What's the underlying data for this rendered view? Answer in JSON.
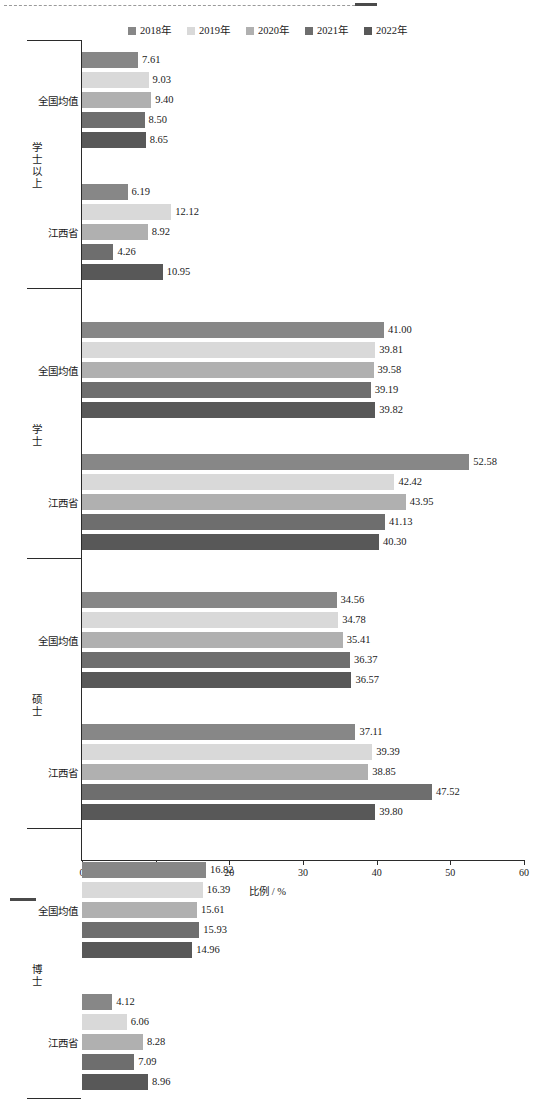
{
  "chart_data": {
    "type": "bar",
    "orientation": "horizontal",
    "title": "",
    "xlabel": "比例 / %",
    "ylabel": "",
    "xlim": [
      0,
      60
    ],
    "xticks": [
      0,
      10,
      20,
      30,
      40,
      50,
      60
    ],
    "grid": false,
    "legend_position": "top-center",
    "series": [
      {
        "name": "2018年",
        "color": "#878787"
      },
      {
        "name": "2019年",
        "color": "#d9d9d9"
      },
      {
        "name": "2020年",
        "color": "#b0b0b0"
      },
      {
        "name": "2021年",
        "color": "#6e6e6e"
      },
      {
        "name": "2022年",
        "color": "#585858"
      }
    ],
    "groups": [
      {
        "level": "学士以上",
        "subgroups": [
          {
            "region": "全国均值",
            "values": [
              7.61,
              9.03,
              9.4,
              8.5,
              8.65
            ]
          },
          {
            "region": "江西省",
            "values": [
              6.19,
              12.12,
              8.92,
              4.26,
              10.95
            ]
          }
        ]
      },
      {
        "level": "学士",
        "subgroups": [
          {
            "region": "全国均值",
            "values": [
              41.0,
              39.81,
              39.58,
              39.19,
              39.82
            ]
          },
          {
            "region": "江西省",
            "values": [
              52.58,
              42.42,
              43.95,
              41.13,
              40.3
            ]
          }
        ]
      },
      {
        "level": "硕士",
        "subgroups": [
          {
            "region": "全国均值",
            "values": [
              34.56,
              34.78,
              35.41,
              36.37,
              36.57
            ]
          },
          {
            "region": "江西省",
            "values": [
              37.11,
              39.39,
              38.85,
              47.52,
              39.8
            ]
          }
        ]
      },
      {
        "level": "博士",
        "subgroups": [
          {
            "region": "全国均值",
            "values": [
              16.82,
              16.39,
              15.61,
              15.93,
              14.96
            ]
          },
          {
            "region": "江西省",
            "values": [
              4.12,
              6.06,
              8.28,
              7.09,
              8.96
            ]
          }
        ]
      }
    ]
  },
  "legend": {
    "items": [
      "2018年",
      "2019年",
      "2020年",
      "2021年",
      "2022年"
    ]
  },
  "axis": {
    "x_title": "比例 / %",
    "x_tick_labels": [
      "0",
      "10",
      "20",
      "30",
      "40",
      "50",
      "60"
    ]
  },
  "caption": {
    "text": ""
  }
}
